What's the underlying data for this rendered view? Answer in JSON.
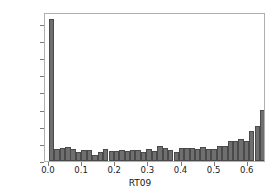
{
  "chart_data": {
    "type": "bar",
    "title": "",
    "xlabel": "RT09",
    "ylabel": "",
    "grid": false,
    "legend": null,
    "xlim": [
      -0.012,
      0.655
    ],
    "ylim": [
      0,
      1740
    ],
    "bin_width": 0.0163,
    "xticks": [
      0.0,
      0.1,
      0.2,
      0.3,
      0.4,
      0.5,
      0.6
    ],
    "xtick_labels": [
      "0.0",
      "0.1",
      "0.2",
      "0.3",
      "0.4",
      "0.5",
      "0.6"
    ],
    "yticks": [
      0,
      200,
      400,
      600,
      800,
      1000,
      1200,
      1400,
      1600
    ],
    "ytick_labels": [
      "0",
      "200",
      "400",
      "600",
      "800",
      "1000",
      "1200",
      "1400",
      "1600"
    ],
    "bin_centers": [
      0.008,
      0.024,
      0.041,
      0.057,
      0.073,
      0.09,
      0.106,
      0.122,
      0.139,
      0.155,
      0.171,
      0.188,
      0.204,
      0.22,
      0.237,
      0.253,
      0.269,
      0.286,
      0.302,
      0.318,
      0.335,
      0.351,
      0.367,
      0.384,
      0.4,
      0.416,
      0.433,
      0.449,
      0.465,
      0.482,
      0.498,
      0.514,
      0.531,
      0.547,
      0.563,
      0.58,
      0.596,
      0.612,
      0.629,
      0.645
    ],
    "values": [
      1660,
      140,
      150,
      160,
      145,
      100,
      125,
      125,
      75,
      110,
      135,
      120,
      115,
      130,
      120,
      130,
      130,
      105,
      140,
      120,
      170,
      150,
      130,
      105,
      150,
      150,
      150,
      145,
      165,
      140,
      140,
      180,
      180,
      230,
      230,
      255,
      235,
      355,
      410,
      595
    ],
    "bar_color": "#6f6f6f",
    "bar_edge_color": "#4a4a4a",
    "frame_color": "#b0b0b0",
    "background_color": "#ffffff"
  }
}
